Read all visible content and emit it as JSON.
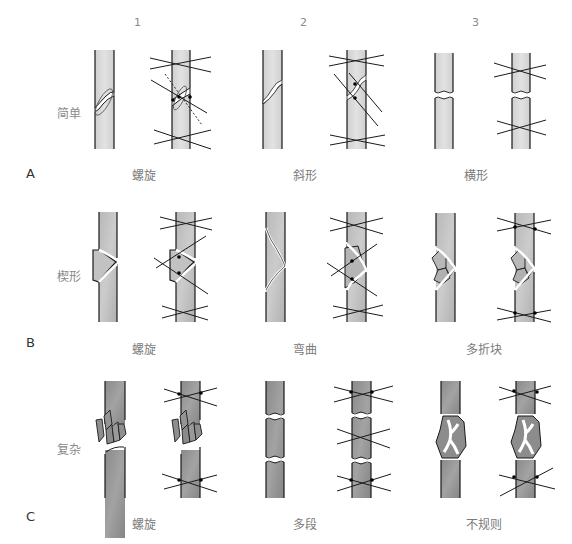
{
  "diagram": {
    "title": "",
    "columns": [
      "1",
      "2",
      "3"
    ],
    "rows": [
      {
        "letter": "A",
        "label": "简单",
        "captions": [
          "螺旋",
          "斜形",
          "横形"
        ]
      },
      {
        "letter": "B",
        "label": "楔形",
        "captions": [
          "螺旋",
          "弯曲",
          "多折块"
        ]
      },
      {
        "letter": "C",
        "label": "复杂",
        "captions": [
          "螺旋",
          "多段",
          "不规则"
        ]
      }
    ],
    "colors": {
      "bone_light": "#d9d9d9",
      "bone_medium": "#bdbdbd",
      "bone_dark": "#8f8f8f",
      "outline": "#1a1a1a",
      "text": "#7a7a7a"
    }
  }
}
